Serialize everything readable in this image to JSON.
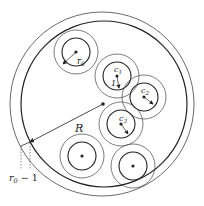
{
  "diagram": {
    "labels": {
      "r0": "r",
      "r0_sub": "0",
      "c1": "c",
      "c1_sub": "1",
      "c2": "c",
      "c2_sub": "2",
      "c3": "c",
      "c3_sub": "3",
      "one": "1",
      "R": "R",
      "r0_minus_1": "r",
      "r0_minus_1_sub": "0",
      "r0_minus_1_tail": " − 1"
    },
    "colors": {
      "stroke": "#222222",
      "thin_stroke": "#444444"
    }
  }
}
